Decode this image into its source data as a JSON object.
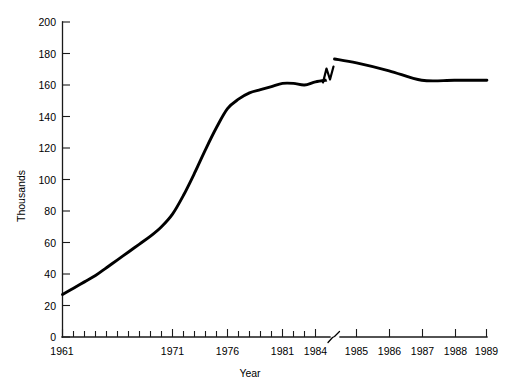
{
  "chart_data": {
    "type": "line",
    "title": "",
    "xlabel": "Year",
    "ylabel": "Thousands",
    "ylim": [
      0,
      200
    ],
    "xlim": [
      1961,
      1989
    ],
    "grid": false,
    "legend": null,
    "y_ticks": [
      0,
      20,
      40,
      60,
      80,
      100,
      120,
      140,
      160,
      180,
      200
    ],
    "x_ticks": [
      1961,
      1962,
      1963,
      1964,
      1965,
      1966,
      1967,
      1968,
      1969,
      1970,
      1971,
      1972,
      1973,
      1974,
      1975,
      1976,
      1977,
      1978,
      1979,
      1980,
      1981,
      1982,
      1983,
      1984,
      1985,
      1986,
      1987,
      1988,
      1989
    ],
    "x_tick_labels": [
      "1961",
      "1971",
      "1976",
      "1981",
      "1984",
      "1985",
      "1986",
      "1987",
      "1988",
      "1989"
    ],
    "axis_break": {
      "between": [
        1984,
        1985
      ],
      "note": "zigzag break on x-axis and on data line"
    },
    "x": [
      1961,
      1962,
      1963,
      1964,
      1965,
      1966,
      1967,
      1968,
      1969,
      1970,
      1971,
      1972,
      1973,
      1974,
      1975,
      1976,
      1977,
      1978,
      1979,
      1980,
      1981,
      1982,
      1983,
      1984,
      1985,
      1986,
      1987,
      1988,
      1989
    ],
    "values": [
      27,
      31,
      35,
      39,
      44,
      49,
      54,
      59,
      64,
      70,
      78,
      90,
      104,
      119,
      133,
      145,
      151,
      155,
      157,
      159,
      161,
      161,
      160,
      162,
      174,
      169,
      163,
      163,
      163
    ],
    "series": [
      {
        "name": "Thousands",
        "values": [
          27,
          31,
          35,
          39,
          44,
          49,
          54,
          59,
          64,
          70,
          78,
          90,
          104,
          119,
          133,
          145,
          151,
          155,
          157,
          159,
          161,
          161,
          160,
          162,
          174,
          169,
          163,
          163,
          163
        ]
      }
    ]
  },
  "axes": {
    "y_title": "Thousands",
    "x_title": "Year",
    "y_tick_labels": [
      "0",
      "20",
      "40",
      "60",
      "80",
      "100",
      "120",
      "140",
      "160",
      "180",
      "200"
    ],
    "x_labeled_ticks": [
      {
        "year": "1961"
      },
      {
        "year": "1971"
      },
      {
        "year": "1976"
      },
      {
        "year": "1981"
      },
      {
        "year": "1984"
      },
      {
        "year": "1985"
      },
      {
        "year": "1986"
      },
      {
        "year": "1987"
      },
      {
        "year": "1988"
      },
      {
        "year": "1989"
      }
    ]
  },
  "colors": {
    "line": "#000000",
    "axis": "#1a1a1a",
    "background": "#ffffff"
  }
}
